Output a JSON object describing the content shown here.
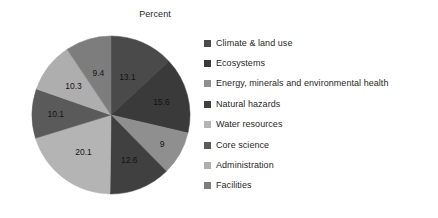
{
  "chart_data": {
    "type": "pie",
    "title": "Percent",
    "xlabel": "",
    "ylabel": "",
    "legend_position": "right",
    "grid": false,
    "start_angle_deg": 90,
    "direction": "clockwise",
    "categories": [
      "Climate & land use",
      "Ecosystems",
      "Energy, minerals and environmental health",
      "Natural hazards",
      "Water resources",
      "Core science",
      "Administration",
      "Facilities"
    ],
    "values": [
      13.1,
      15.6,
      9,
      12.6,
      20.1,
      10.1,
      10.3,
      9.4
    ],
    "value_labels": [
      "13.1",
      "15.6",
      "9",
      "12.6",
      "20.1",
      "10.1",
      "10.3",
      "9.4"
    ],
    "colors": [
      "#4a4a4a",
      "#3a3a3a",
      "#8f8f8f",
      "#404040",
      "#b4b4b4",
      "#5a5a5a",
      "#aeaeae",
      "#7d7d7d"
    ],
    "total": 100.2
  },
  "chart": {
    "title": "Percent",
    "slices": [
      {
        "label": "Climate & land use",
        "value": 13.1,
        "value_label": "13.1",
        "color": "#4a4a4a"
      },
      {
        "label": "Ecosystems",
        "value": 15.6,
        "value_label": "15.6",
        "color": "#3a3a3a"
      },
      {
        "label": "Energy, minerals and environmental health",
        "value": 9.0,
        "value_label": "9",
        "color": "#8f8f8f"
      },
      {
        "label": "Natural hazards",
        "value": 12.6,
        "value_label": "12.6",
        "color": "#404040"
      },
      {
        "label": "Water resources",
        "value": 20.1,
        "value_label": "20.1",
        "color": "#b4b4b4"
      },
      {
        "label": "Core science",
        "value": 10.1,
        "value_label": "10.1",
        "color": "#5a5a5a"
      },
      {
        "label": "Administration",
        "value": 10.3,
        "value_label": "10.3",
        "color": "#aeaeae"
      },
      {
        "label": "Facilities",
        "value": 9.4,
        "value_label": "9.4",
        "color": "#7d7d7d"
      }
    ]
  },
  "legend": {
    "items": [
      {
        "label": "Climate & land use",
        "color": "#4a4a4a"
      },
      {
        "label": "Ecosystems",
        "color": "#3a3a3a"
      },
      {
        "label": "Energy, minerals and environmental health",
        "color": "#8f8f8f"
      },
      {
        "label": "Natural hazards",
        "color": "#404040"
      },
      {
        "label": "Water resources",
        "color": "#b4b4b4"
      },
      {
        "label": "Core science",
        "color": "#5a5a5a"
      },
      {
        "label": "Administration",
        "color": "#aeaeae"
      },
      {
        "label": "Facilities",
        "color": "#7d7d7d"
      }
    ]
  }
}
